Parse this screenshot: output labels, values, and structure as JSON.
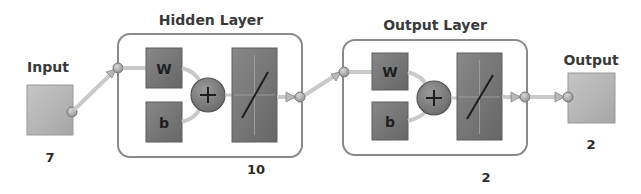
{
  "diagram": {
    "type": "neural-network-architecture",
    "input": {
      "label": "Input",
      "size": "7"
    },
    "layers": [
      {
        "title": "Hidden Layer",
        "size": "10",
        "weight_label": "W",
        "bias_label": "b",
        "sum_symbol": "+",
        "transfer": "linear"
      },
      {
        "title": "Output Layer",
        "size": "2",
        "weight_label": "W",
        "bias_label": "b",
        "sum_symbol": "+",
        "transfer": "linear"
      }
    ],
    "output": {
      "label": "Output",
      "size": "2"
    }
  },
  "colors": {
    "io_box": "#b4b4b4",
    "param_box": "#767676",
    "transfer_box": "#7a7a7a",
    "layer_border": "#8a8a8a",
    "connector": "#c9c9c9",
    "node": "#a8a8a8",
    "text": "#3a3a3a"
  }
}
